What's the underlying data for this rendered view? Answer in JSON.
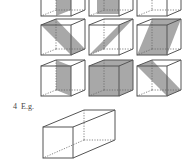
{
  "exercise": {
    "number": "4",
    "label": "E.g."
  },
  "colors": {
    "stroke": "#555555",
    "shade": "#a8a8a8",
    "background": "#ffffff"
  },
  "cube_grid": {
    "rows": 3,
    "cols": 3,
    "description": "Cubes showing planes of symmetry (shaded cross-sections)",
    "cells": [
      {
        "row": 0,
        "col": 0,
        "plane": "vertical-mid-front-back"
      },
      {
        "row": 0,
        "col": 1,
        "plane": "vertical-mid-front-back"
      },
      {
        "row": 0,
        "col": 2,
        "plane": "vertical-mid-left-right"
      },
      {
        "row": 1,
        "col": 0,
        "plane": "diagonal-top-edge-to-bottom-edge"
      },
      {
        "row": 1,
        "col": 1,
        "plane": "diagonal-vertical"
      },
      {
        "row": 1,
        "col": 2,
        "plane": "diagonal-top-back-to-bottom-front"
      },
      {
        "row": 2,
        "col": 0,
        "plane": "vertical-mid-side"
      },
      {
        "row": 2,
        "col": 1,
        "plane": "vertical-mid-front"
      },
      {
        "row": 2,
        "col": 2,
        "plane": "diagonal-slanted"
      }
    ]
  },
  "prism": {
    "description": "Square-based cuboid (prism)"
  }
}
